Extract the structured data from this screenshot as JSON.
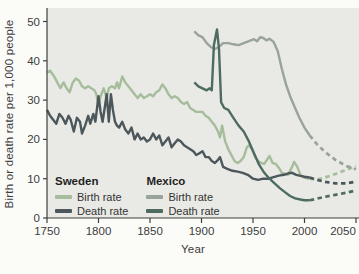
{
  "page": {
    "background": "#fbfbf8",
    "plot_background": "#e9eae6",
    "axis_color": "#3f3f3f",
    "text_color": "#3c3c3c"
  },
  "y_axis": {
    "label": "Birth or death rate per 1,000 people",
    "ticks": [
      0,
      10,
      20,
      30,
      40,
      50
    ]
  },
  "x_axis": {
    "label": "Year",
    "ticks": [
      1750,
      1800,
      1850,
      1900,
      1950,
      2000,
      2050
    ]
  },
  "legend": {
    "groups": [
      {
        "title": "Sweden",
        "items": [
          {
            "label": "Birth rate",
            "color": "#a6bd9c"
          },
          {
            "label": "Death rate",
            "color": "#4c575b"
          }
        ]
      },
      {
        "title": "Mexico",
        "items": [
          {
            "label": "Birth rate",
            "color": "#9aa29c"
          },
          {
            "label": "Death rate",
            "color": "#4d6b60"
          }
        ]
      }
    ]
  },
  "chart_data": {
    "type": "line",
    "title": "",
    "xlabel": "Year",
    "ylabel": "Birth or death rate per 1,000 people",
    "xlim": [
      1750,
      2055
    ],
    "ylim": [
      0,
      52
    ],
    "grid": false,
    "legend_position": "inside bottom-left",
    "note": "Dashed segments after ~2005 are projections to 2050",
    "series": [
      {
        "name": "Sweden birth rate",
        "color": "#a6bd9c",
        "style": "solid",
        "points": [
          [
            1750,
            37
          ],
          [
            1753,
            37.5
          ],
          [
            1757,
            36
          ],
          [
            1760,
            34.5
          ],
          [
            1763,
            33
          ],
          [
            1766,
            34.5
          ],
          [
            1769,
            33
          ],
          [
            1772,
            32
          ],
          [
            1775,
            34.5
          ],
          [
            1778,
            35.5
          ],
          [
            1781,
            35
          ],
          [
            1784,
            33.5
          ],
          [
            1787,
            33
          ],
          [
            1790,
            33.5
          ],
          [
            1793,
            33
          ],
          [
            1796,
            32.5
          ],
          [
            1798,
            31.5
          ],
          [
            1800,
            28.5
          ],
          [
            1802,
            31
          ],
          [
            1805,
            33
          ],
          [
            1808,
            30.5
          ],
          [
            1810,
            33
          ],
          [
            1813,
            33.5
          ],
          [
            1816,
            33
          ],
          [
            1818,
            34.5
          ],
          [
            1820,
            33
          ],
          [
            1823,
            36
          ],
          [
            1826,
            34.5
          ],
          [
            1829,
            33.5
          ],
          [
            1832,
            32.5
          ],
          [
            1835,
            31.5
          ],
          [
            1838,
            30.5
          ],
          [
            1841,
            31.5
          ],
          [
            1844,
            30.5
          ],
          [
            1847,
            31
          ],
          [
            1850,
            31.5
          ],
          [
            1853,
            31
          ],
          [
            1856,
            32
          ],
          [
            1859,
            32.5
          ],
          [
            1862,
            34
          ],
          [
            1865,
            33
          ],
          [
            1868,
            31.5
          ],
          [
            1871,
            30.5
          ],
          [
            1874,
            31
          ],
          [
            1877,
            30.5
          ],
          [
            1880,
            29.5
          ],
          [
            1883,
            29
          ],
          [
            1886,
            29.5
          ],
          [
            1889,
            28
          ],
          [
            1892,
            27.5
          ],
          [
            1895,
            27
          ],
          [
            1898,
            27
          ],
          [
            1901,
            27
          ],
          [
            1904,
            26
          ],
          [
            1907,
            25.5
          ],
          [
            1910,
            24.5
          ],
          [
            1913,
            23.5
          ],
          [
            1916,
            22
          ],
          [
            1918,
            20.5
          ],
          [
            1920,
            23.5
          ],
          [
            1923,
            19.5
          ],
          [
            1926,
            17.5
          ],
          [
            1929,
            16
          ],
          [
            1932,
            14.5
          ],
          [
            1935,
            14
          ],
          [
            1938,
            14.5
          ],
          [
            1941,
            15.5
          ],
          [
            1944,
            18
          ],
          [
            1946,
            18.5
          ],
          [
            1949,
            17.5
          ],
          [
            1952,
            15.5
          ],
          [
            1955,
            14.5
          ],
          [
            1958,
            14
          ],
          [
            1961,
            13.8
          ],
          [
            1964,
            15
          ],
          [
            1966,
            15.8
          ],
          [
            1969,
            14
          ],
          [
            1972,
            13.8
          ],
          [
            1975,
            12.8
          ],
          [
            1978,
            11.5
          ],
          [
            1981,
            11.3
          ],
          [
            1984,
            11
          ],
          [
            1987,
            12.5
          ],
          [
            1990,
            14.3
          ],
          [
            1993,
            13
          ],
          [
            1996,
            11
          ],
          [
            2000,
            10.2
          ],
          [
            2005,
            10
          ]
        ]
      },
      {
        "name": "Sweden birth rate (projected)",
        "color": "#a6bd9c",
        "style": "dashed",
        "points": [
          [
            2005,
            10
          ],
          [
            2012,
            9.8
          ],
          [
            2020,
            10.3
          ],
          [
            2030,
            11.2
          ],
          [
            2040,
            12.2
          ],
          [
            2050,
            13.2
          ]
        ]
      },
      {
        "name": "Sweden death rate",
        "color": "#4c575b",
        "style": "solid",
        "points": [
          [
            1750,
            27.5
          ],
          [
            1753,
            26
          ],
          [
            1756,
            25
          ],
          [
            1759,
            24
          ],
          [
            1762,
            26.5
          ],
          [
            1765,
            25.5
          ],
          [
            1768,
            24
          ],
          [
            1771,
            26
          ],
          [
            1773,
            25
          ],
          [
            1776,
            22
          ],
          [
            1779,
            25.5
          ],
          [
            1782,
            24.5
          ],
          [
            1784,
            21.5
          ],
          [
            1787,
            23.5
          ],
          [
            1790,
            26
          ],
          [
            1792,
            24
          ],
          [
            1795,
            26.5
          ],
          [
            1797,
            24.5
          ],
          [
            1800,
            31
          ],
          [
            1802,
            27
          ],
          [
            1804,
            24.5
          ],
          [
            1806,
            28
          ],
          [
            1808,
            31.5
          ],
          [
            1810,
            24.5
          ],
          [
            1812,
            31.5
          ],
          [
            1814,
            27.5
          ],
          [
            1816,
            24.5
          ],
          [
            1818,
            23.5
          ],
          [
            1820,
            23
          ],
          [
            1823,
            24.5
          ],
          [
            1826,
            22.5
          ],
          [
            1829,
            21.5
          ],
          [
            1832,
            23
          ],
          [
            1835,
            20
          ],
          [
            1838,
            21.5
          ],
          [
            1841,
            20
          ],
          [
            1844,
            20.5
          ],
          [
            1847,
            19.5
          ],
          [
            1850,
            20
          ],
          [
            1853,
            21.5
          ],
          [
            1856,
            20
          ],
          [
            1859,
            21
          ],
          [
            1862,
            18.5
          ],
          [
            1865,
            19.5
          ],
          [
            1868,
            20.5
          ],
          [
            1871,
            18
          ],
          [
            1874,
            19
          ],
          [
            1877,
            20
          ],
          [
            1880,
            19.5
          ],
          [
            1883,
            18.5
          ],
          [
            1886,
            18
          ],
          [
            1889,
            17.5
          ],
          [
            1892,
            17
          ],
          [
            1895,
            16
          ],
          [
            1898,
            16.5
          ],
          [
            1901,
            17
          ],
          [
            1904,
            15.5
          ],
          [
            1907,
            15.5
          ],
          [
            1910,
            14.5
          ],
          [
            1913,
            14
          ],
          [
            1916,
            14.8
          ],
          [
            1918,
            15.5
          ],
          [
            1921,
            13
          ],
          [
            1925,
            12.5
          ],
          [
            1930,
            12
          ],
          [
            1935,
            11.8
          ],
          [
            1940,
            11.5
          ],
          [
            1945,
            11
          ],
          [
            1950,
            10
          ],
          [
            1955,
            9.7
          ],
          [
            1960,
            10
          ],
          [
            1965,
            10
          ],
          [
            1970,
            10.4
          ],
          [
            1975,
            10.8
          ],
          [
            1980,
            11
          ],
          [
            1985,
            11.4
          ],
          [
            1988,
            11.5
          ],
          [
            1992,
            11
          ],
          [
            1996,
            10.7
          ],
          [
            2000,
            10.5
          ],
          [
            2005,
            10.3
          ]
        ]
      },
      {
        "name": "Sweden death rate (projected)",
        "color": "#4c575b",
        "style": "dashed",
        "points": [
          [
            2005,
            10.3
          ],
          [
            2012,
            9.7
          ],
          [
            2020,
            9.2
          ],
          [
            2030,
            8.8
          ],
          [
            2040,
            8.8
          ],
          [
            2050,
            9.2
          ]
        ]
      },
      {
        "name": "Mexico birth rate",
        "color": "#9aa29c",
        "style": "solid",
        "points": [
          [
            1893,
            47.5
          ],
          [
            1897,
            46.5
          ],
          [
            1901,
            46
          ],
          [
            1905,
            44.5
          ],
          [
            1909,
            43.5
          ],
          [
            1913,
            43
          ],
          [
            1917,
            43.5
          ],
          [
            1921,
            44.5
          ],
          [
            1926,
            44.5
          ],
          [
            1931,
            44.2
          ],
          [
            1936,
            44
          ],
          [
            1941,
            44.5
          ],
          [
            1946,
            45
          ],
          [
            1951,
            45.5
          ],
          [
            1954,
            45
          ],
          [
            1957,
            46
          ],
          [
            1960,
            45.8
          ],
          [
            1963,
            45.2
          ],
          [
            1966,
            45.6
          ],
          [
            1970,
            44.8
          ],
          [
            1974,
            42.5
          ],
          [
            1978,
            38
          ],
          [
            1982,
            34
          ],
          [
            1986,
            31
          ],
          [
            1990,
            28.5
          ],
          [
            1995,
            25.5
          ],
          [
            2000,
            23
          ],
          [
            2005,
            21
          ]
        ]
      },
      {
        "name": "Mexico birth rate (projected)",
        "color": "#9aa29c",
        "style": "dashed",
        "points": [
          [
            2005,
            21
          ],
          [
            2012,
            18.8
          ],
          [
            2020,
            16.8
          ],
          [
            2030,
            14.8
          ],
          [
            2040,
            13.3
          ],
          [
            2050,
            12.4
          ]
        ]
      },
      {
        "name": "Mexico death rate",
        "color": "#4d6b60",
        "style": "solid",
        "points": [
          [
            1893,
            34.5
          ],
          [
            1897,
            33.5
          ],
          [
            1901,
            33
          ],
          [
            1905,
            32.5
          ],
          [
            1908,
            33
          ],
          [
            1910,
            32.5
          ],
          [
            1912,
            44
          ],
          [
            1915,
            48
          ],
          [
            1917,
            43
          ],
          [
            1919,
            29.5
          ],
          [
            1922,
            28
          ],
          [
            1926,
            27.5
          ],
          [
            1931,
            25.5
          ],
          [
            1936,
            23.5
          ],
          [
            1941,
            22
          ],
          [
            1946,
            19.5
          ],
          [
            1951,
            16.5
          ],
          [
            1956,
            13.5
          ],
          [
            1961,
            11.5
          ],
          [
            1966,
            10
          ],
          [
            1971,
            8.8
          ],
          [
            1976,
            7.6
          ],
          [
            1981,
            6.6
          ],
          [
            1986,
            5.6
          ],
          [
            1991,
            5
          ],
          [
            1996,
            4.7
          ],
          [
            2000,
            4.5
          ],
          [
            2005,
            4.5
          ]
        ]
      },
      {
        "name": "Mexico death rate (projected)",
        "color": "#4d6b60",
        "style": "dashed",
        "points": [
          [
            2005,
            4.5
          ],
          [
            2012,
            4.9
          ],
          [
            2020,
            5.4
          ],
          [
            2030,
            5.9
          ],
          [
            2040,
            6.4
          ],
          [
            2050,
            7
          ]
        ]
      }
    ]
  }
}
